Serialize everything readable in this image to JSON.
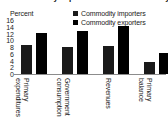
{
  "chart_data": {
    "type": "bar",
    "title": "Commodity exporters versus commodity importers",
    "categories": [
      "Primary expenditures",
      "Government consumption",
      "Revenues",
      "Primary balance"
    ],
    "category_lines": [
      [
        "Primary",
        "expenditures"
      ],
      [
        "Government",
        "consumption"
      ],
      [
        "Revenues",
        ""
      ],
      [
        "Primary",
        "balance"
      ]
    ],
    "series": [
      {
        "name": "Commodity importers",
        "color": "#1a1a1a",
        "values": [
          8.5,
          8.0,
          8.3,
          3.5
        ]
      },
      {
        "name": "Commodity exporters",
        "color": "#000000",
        "values": [
          12.3,
          12.8,
          14.3,
          6.2
        ]
      }
    ],
    "ylabel": "Percent",
    "xlabel": "",
    "ylim": [
      0,
      16
    ],
    "yticks": [
      "16",
      "14",
      "12",
      "10",
      "8",
      "6",
      "4",
      "2",
      "0"
    ],
    "grid": false,
    "legend_position": "top-right"
  },
  "axis": {
    "unit_label": "Percent"
  },
  "legend": {
    "items": [
      {
        "label": "Commodity importers",
        "swatch": "#1a1a1a"
      },
      {
        "label": "Commodity exporters",
        "swatch": "#000000"
      }
    ]
  }
}
